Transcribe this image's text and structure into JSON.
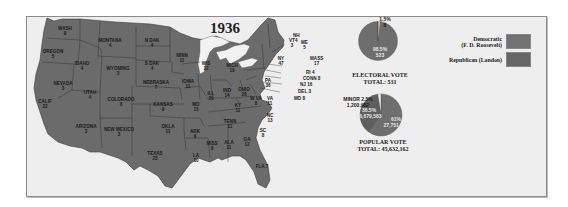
{
  "title": "1936",
  "colors": {
    "democratic": "#6b6b6b",
    "republican": "#5e5e5e",
    "water": "#f2f2f2",
    "background": "#eeeeee"
  },
  "legend": [
    {
      "label_line1": "Democratic",
      "label_line2": "(F. D. Roosevelt)",
      "color": "#727272"
    },
    {
      "label_line1": "Republican (Landon)",
      "label_line2": "",
      "color": "#666666"
    }
  ],
  "states": [
    {
      "name": "WASH",
      "ev": "8"
    },
    {
      "name": "OREGON",
      "ev": "5"
    },
    {
      "name": "CALIF",
      "ev": "22"
    },
    {
      "name": "IDAHO",
      "ev": "4"
    },
    {
      "name": "NEVADA",
      "ev": "3"
    },
    {
      "name": "MONTANA",
      "ev": "4"
    },
    {
      "name": "WYOMING",
      "ev": "3"
    },
    {
      "name": "UTAH",
      "ev": "4"
    },
    {
      "name": "ARIZONA",
      "ev": "3"
    },
    {
      "name": "COLORADO",
      "ev": "6"
    },
    {
      "name": "NEW MEXICO",
      "ev": "3"
    },
    {
      "name": "N DAK",
      "ev": "4"
    },
    {
      "name": "S DAK",
      "ev": "4"
    },
    {
      "name": "NEBRASKA",
      "ev": "7"
    },
    {
      "name": "KANSAS",
      "ev": "9"
    },
    {
      "name": "OKLA",
      "ev": "11"
    },
    {
      "name": "TEXAS",
      "ev": "23"
    },
    {
      "name": "MINN",
      "ev": "11"
    },
    {
      "name": "IOWA",
      "ev": "11"
    },
    {
      "name": "MO",
      "ev": "15"
    },
    {
      "name": "ARK",
      "ev": "9"
    },
    {
      "name": "LA",
      "ev": "10"
    },
    {
      "name": "WIS",
      "ev": "12"
    },
    {
      "name": "ILL",
      "ev": "29"
    },
    {
      "name": "MICH",
      "ev": "19"
    },
    {
      "name": "IND",
      "ev": "14"
    },
    {
      "name": "OHIO",
      "ev": "26"
    },
    {
      "name": "KY",
      "ev": "11"
    },
    {
      "name": "TENN",
      "ev": "11"
    },
    {
      "name": "MISS",
      "ev": "9"
    },
    {
      "name": "ALA",
      "ev": "11"
    },
    {
      "name": "GA",
      "ev": "12"
    },
    {
      "name": "FLA",
      "ev": "7"
    },
    {
      "name": "SC",
      "ev": "8"
    },
    {
      "name": "NC",
      "ev": "13"
    },
    {
      "name": "VA",
      "ev": "11"
    },
    {
      "name": "W VA",
      "ev": "8"
    },
    {
      "name": "PA",
      "ev": "36"
    },
    {
      "name": "NY",
      "ev": "47"
    },
    {
      "name": "VT",
      "ev": "3"
    },
    {
      "name": "NH",
      "ev": "4"
    },
    {
      "name": "ME",
      "ev": "5"
    },
    {
      "name": "MASS",
      "ev": "17"
    },
    {
      "name": "RI",
      "ev": "4"
    },
    {
      "name": "CONN",
      "ev": "8"
    },
    {
      "name": "NJ",
      "ev": "16"
    },
    {
      "name": "DEL",
      "ev": "3"
    },
    {
      "name": "MD",
      "ev": "8"
    }
  ],
  "electoral_vote": {
    "caption": "ELECTORAL VOTE",
    "total_label": "TOTAL: 531",
    "republican_pct": "1.5%",
    "republican_votes": "8",
    "democratic_pct": "98.5%",
    "democratic_votes": "523"
  },
  "popular_vote": {
    "caption": "POPULAR VOTE",
    "total_label": "TOTAL: 45,632,162",
    "minor_pct": "MINOR 2.5%",
    "minor_votes": "1,200,982",
    "republican_pct": "36.5%",
    "republican_votes": "16,679,583",
    "democratic_pct": "61%",
    "democratic_votes": "27,751,597"
  }
}
